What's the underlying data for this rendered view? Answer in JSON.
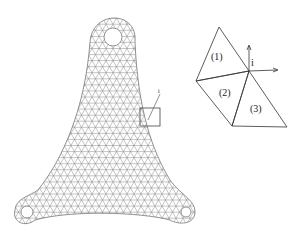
{
  "figure": {
    "mesh": {
      "description": "triangular finite element mesh of a three-lobed bracket with three holes",
      "inset_label": "i",
      "stroke_color": "#8a8a8a"
    },
    "detail": {
      "node_label": "i",
      "elements": [
        {
          "label": "(1)"
        },
        {
          "label": "(2)"
        },
        {
          "label": "(3)"
        }
      ],
      "stroke_color": "#333333"
    }
  }
}
